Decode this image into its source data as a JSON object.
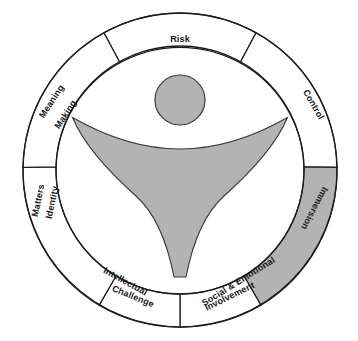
{
  "diagram": {
    "type": "radial-segment-wheel",
    "center_shape": "abstract-human-figure",
    "segments": [
      {
        "id": "risk",
        "label": "Risk",
        "lines": [
          "Risk"
        ],
        "shaded": false,
        "start_angle": -29,
        "end_angle": 29
      },
      {
        "id": "control",
        "label": "Control",
        "lines": [
          "Control"
        ],
        "shaded": false,
        "start_angle": 29,
        "end_angle": 89
      },
      {
        "id": "immersion",
        "label": "Immersion",
        "lines": [
          "Immersion"
        ],
        "shaded": true,
        "start_angle": 89,
        "end_angle": 149
      },
      {
        "id": "social",
        "label": "Social & Emotional Involvement",
        "lines": [
          "Social & Emotional",
          "Involvement"
        ],
        "shaded": false,
        "start_angle": 149,
        "end_angle": 209
      },
      {
        "id": "intellect",
        "label": "Intellectual Challenge",
        "lines": [
          "Intellectual",
          "Challenge"
        ],
        "shaded": false,
        "start_angle": 209,
        "end_angle": 269
      },
      {
        "id": "identity",
        "label": "Identity Matters",
        "lines": [
          "Identity",
          "Matters"
        ],
        "shaded": false,
        "start_angle": 269,
        "end_angle": 327
      },
      {
        "id": "meaning",
        "label": "Meaning Making",
        "lines": [
          "Meaning",
          "Making"
        ],
        "shaded": false,
        "start_angle": 327,
        "end_angle": 331
      }
    ],
    "colors": {
      "shaded_fill": "#b3b3b3",
      "plain_fill": "#ffffff",
      "stroke": "#1d1d1d",
      "background": "#ffffff"
    }
  },
  "labels": {
    "risk": "Risk",
    "control": "Control",
    "immersion": "Immersion",
    "social_line1": "Social & Emotional",
    "social_line2": "Involvement",
    "intellectual_line1": "Intellectual",
    "intellectual_line2": "Challenge",
    "identity_line1": "Identity",
    "identity_line2": "Matters",
    "meaning_line1": "Meaning",
    "meaning_line2": "Making"
  }
}
